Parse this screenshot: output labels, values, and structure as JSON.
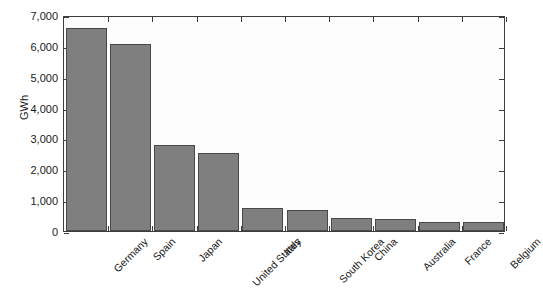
{
  "chart_data": {
    "type": "bar",
    "title": "",
    "xlabel": "",
    "ylabel": "GWh",
    "categories": [
      "Germany",
      "Spain",
      "Japan",
      "United States",
      "Italy",
      "South Korea",
      "China",
      "Australia",
      "France",
      "Belgium"
    ],
    "values": [
      6580,
      6060,
      2790,
      2530,
      760,
      670,
      410,
      400,
      290,
      280
    ],
    "ylim": [
      0,
      7000
    ],
    "yticks": [
      0,
      1000,
      2000,
      3000,
      4000,
      5000,
      6000,
      7000
    ],
    "ytick_labels": [
      "0",
      "1,000",
      "2,000",
      "3,000",
      "4,000",
      "5,000",
      "6,000",
      "7,000"
    ],
    "grid": false,
    "legend": null,
    "bar_color": "#7f7f7f",
    "bar_edge_color": "#494949",
    "plot_background": "#fdfdfd",
    "axis_color": "#3d3d3d",
    "xtick_label_rotation": -45
  }
}
